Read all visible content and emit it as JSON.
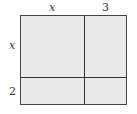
{
  "diagram": {
    "type": "area-model",
    "top_labels": [
      "x",
      "3"
    ],
    "side_labels": [
      "x",
      "2"
    ],
    "fill_color": "#e9e9e9",
    "line_color": "#333333"
  }
}
